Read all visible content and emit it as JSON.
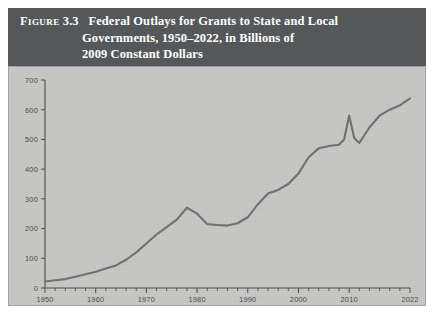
{
  "figure": {
    "label": "Figure",
    "number": "3.3",
    "title_lines": [
      "Federal Outlays for Grants to State and Local",
      "Governments, 1950–2022, in Billions of",
      "2009 Constant Dollars"
    ],
    "band_color": "#55585a",
    "panel_color": "#c6c6c3",
    "line_color": "#6e7071",
    "axis_color": "#4b4d4e"
  },
  "chart_data": {
    "type": "line",
    "title": "Federal Outlays for Grants to State and Local Governments, 1950–2022, in Billions of 2009 Constant Dollars",
    "xlabel": "",
    "ylabel": "",
    "xlim": [
      1950,
      2022
    ],
    "ylim": [
      0,
      700
    ],
    "grid": false,
    "legend": "none",
    "y_ticks": [
      0,
      100,
      200,
      300,
      400,
      500,
      600,
      700
    ],
    "y_tick_labels": [
      "0",
      "100",
      "200",
      "300",
      "400",
      "500",
      "600",
      "700"
    ],
    "x_ticks": [
      1950,
      1960,
      1970,
      1980,
      1990,
      2000,
      2010,
      2022
    ],
    "x_tick_labels": [
      "1950",
      "1960",
      "1970",
      "1980",
      "1990",
      "2000",
      "2010",
      "2022"
    ],
    "x_minor_tick_step": 2,
    "series": [
      {
        "name": "Federal grants to state and local governments",
        "x": [
          1950,
          1952,
          1954,
          1956,
          1958,
          1960,
          1962,
          1964,
          1966,
          1968,
          1970,
          1972,
          1974,
          1976,
          1978,
          1980,
          1982,
          1984,
          1986,
          1988,
          1990,
          1992,
          1994,
          1996,
          1998,
          2000,
          2002,
          2004,
          2006,
          2008,
          2009,
          2010,
          2011,
          2012,
          2014,
          2016,
          2018,
          2020,
          2022
        ],
        "values": [
          22,
          26,
          30,
          38,
          46,
          55,
          66,
          76,
          95,
          120,
          150,
          180,
          205,
          230,
          270,
          250,
          215,
          212,
          210,
          218,
          238,
          282,
          318,
          330,
          350,
          385,
          440,
          470,
          478,
          482,
          500,
          580,
          505,
          488,
          540,
          580,
          600,
          615,
          638
        ]
      }
    ]
  }
}
